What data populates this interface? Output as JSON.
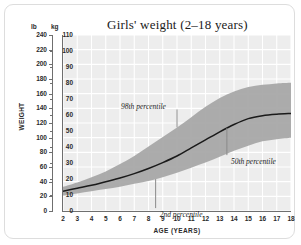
{
  "chart_data": {
    "type": "area",
    "title": "Girls' weight (2–18 years)",
    "xlabel": "AGE (YEARS)",
    "ylabel": "WEIGHT",
    "unit_left": "lb",
    "unit_right": "kg",
    "grid": true,
    "legend_position": "none",
    "xlim": [
      2,
      18
    ],
    "ylim_lb": [
      0,
      240
    ],
    "ylim_kg": [
      0,
      110
    ],
    "xticks": [
      2,
      3,
      4,
      5,
      6,
      7,
      8,
      9,
      10,
      11,
      12,
      13,
      14,
      15,
      16,
      17,
      18
    ],
    "yticks_lb": [
      240,
      220,
      200,
      180,
      160,
      140,
      120,
      100,
      80,
      60,
      40,
      20,
      0
    ],
    "yticks_kg": [
      110,
      100,
      90,
      80,
      70,
      60,
      50,
      40,
      30,
      20,
      10,
      0
    ],
    "x": [
      2,
      3,
      4,
      5,
      6,
      7,
      8,
      9,
      10,
      11,
      12,
      13,
      14,
      15,
      16,
      17,
      18
    ],
    "series": [
      {
        "name": "98th percentile",
        "values": [
          33,
          39,
          46,
          54,
          64,
          75,
          88,
          101,
          114,
          128,
          142,
          154,
          163,
          169,
          172,
          174,
          175
        ]
      },
      {
        "name": "50th percentile",
        "values": [
          27,
          31,
          35,
          40,
          45,
          51,
          58,
          66,
          75,
          86,
          97,
          108,
          118,
          126,
          130,
          132,
          133
        ]
      },
      {
        "name": "2nd percentile",
        "values": [
          21,
          24,
          27,
          30,
          33,
          37,
          41,
          46,
          52,
          59,
          66,
          74,
          82,
          89,
          95,
          98,
          100
        ]
      }
    ],
    "annotations": [
      {
        "text": "98th percentile",
        "x": 10,
        "y_lb": 142
      },
      {
        "text": "2nd percentile",
        "x": 8.5,
        "y_lb": 41
      },
      {
        "text": "50th percentile",
        "x": 13.5,
        "y_lb": 108
      }
    ],
    "colors": {
      "band": "#a8a8a8",
      "median_line": "#1a1a1a",
      "plot_background": "#ededed",
      "gridline": "#ffffff",
      "axis": "#6f6f6f",
      "frame": "#dddddd"
    }
  }
}
